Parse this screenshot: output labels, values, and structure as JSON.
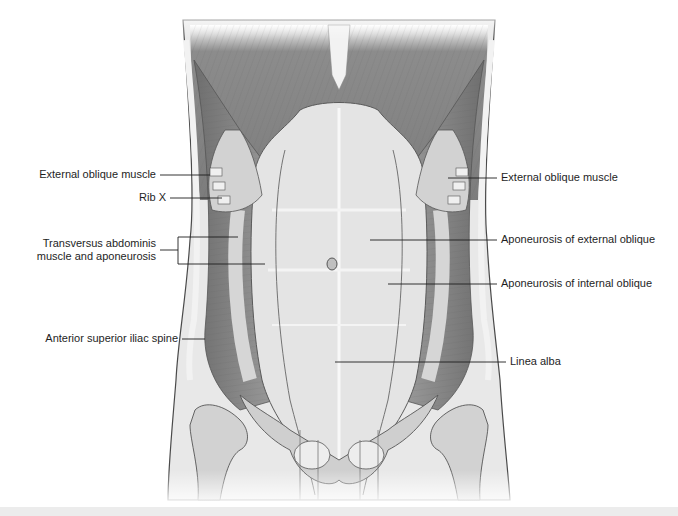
{
  "figure": {
    "colors": {
      "muscle": "#8a8a8a",
      "muscle_dark": "#6e6e6e",
      "aponeurosis": "#dcdcdc",
      "aponeurosis_light": "#ececec",
      "skin_outline": "#4a4a4a",
      "skin_fill": "#e6e6e6",
      "bone": "#c8c8c8",
      "leader_line": "#1e1e1e",
      "label_text": "#1e1e1e",
      "background": "#ffffff",
      "caption_bar": "#ececec"
    },
    "labels_left": [
      {
        "text": "External oblique muscle",
        "x": 210,
        "y": 175
      },
      {
        "text": "Rib X",
        "x": 148,
        "y": 198
      },
      {
        "text": "Transversus abdominis",
        "line2": "muscle and aponeurosis",
        "x": 180,
        "y": 250
      },
      {
        "text": "Anterior superior iliac spine",
        "x": 180,
        "y": 339
      }
    ],
    "labels_right": [
      {
        "text": "External oblique muscle",
        "x": 500,
        "y": 178
      },
      {
        "text": "Aponeurosis of external oblique",
        "x": 500,
        "y": 240
      },
      {
        "text": "Aponeurosis of internal oblique",
        "x": 500,
        "y": 284
      },
      {
        "text": "Linea alba",
        "x": 510,
        "y": 362
      }
    ]
  }
}
